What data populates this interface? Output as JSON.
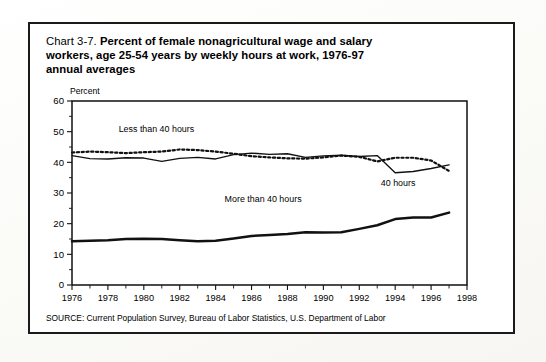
{
  "figure": {
    "number": "Chart 3-7.",
    "title": "Percent of female nonagricultural wage and salary workers, age 25-54 years by weekly hours at work, 1976-97 annual averages",
    "title_line1_lead": "Chart 3-7.",
    "title_line1_bold": "Percent of female nonagricultural wage and salary",
    "title_line2_bold": "workers, age 25-54 years by weekly hours at work, 1976-97",
    "title_line3_bold": "annual averages",
    "source": "SOURCE: Current Population Survey, Bureau of Labor Statistics, U.S. Department of Labor",
    "axis_unit_label": "Percent"
  },
  "colors": {
    "ink": "#111111",
    "paper": "#ffffff",
    "page": "#fdfdfb"
  },
  "chart_data": {
    "type": "line",
    "title": "Percent of female nonagricultural wage and salary workers, age 25-54 years by weekly hours at work, 1976-97 annual averages",
    "subtitle": "",
    "xlabel": "",
    "ylabel": "Percent",
    "xlim": [
      1976,
      1998
    ],
    "ylim": [
      0,
      60
    ],
    "yticks": [
      0,
      10,
      20,
      30,
      40,
      50,
      60
    ],
    "ytick_labels": [
      "0",
      "10",
      "20",
      "30",
      "40",
      "50",
      "60"
    ],
    "xticks": [
      1976,
      1978,
      1980,
      1982,
      1984,
      1986,
      1988,
      1990,
      1992,
      1994,
      1996,
      1998
    ],
    "xtick_labels": [
      "1976",
      "1978",
      "1980",
      "1982",
      "1984",
      "1986",
      "1988",
      "1990",
      "1992",
      "1994",
      "1996",
      "1998"
    ],
    "x_minor_tick_interval": 1,
    "grid": false,
    "legend": "inline-annotations",
    "x": [
      1976,
      1977,
      1978,
      1979,
      1980,
      1981,
      1982,
      1983,
      1984,
      1985,
      1986,
      1987,
      1988,
      1989,
      1990,
      1991,
      1992,
      1993,
      1994,
      1995,
      1996,
      1997
    ],
    "series": [
      {
        "name": "Less than 40 hours",
        "style": "dotted",
        "label_x": 1978.6,
        "label_y": 50.0,
        "values": [
          43.2,
          43.5,
          43.3,
          43.0,
          43.3,
          43.5,
          44.2,
          44.0,
          43.5,
          42.8,
          42.0,
          41.6,
          41.3,
          41.2,
          41.6,
          42.2,
          41.8,
          40.3,
          41.5,
          41.5,
          40.6,
          37.2
        ]
      },
      {
        "name": "40 hours",
        "style": "solid-thin",
        "label_x": 1993.2,
        "label_y": 32.4,
        "values": [
          42.2,
          41.2,
          41.1,
          41.5,
          41.4,
          40.3,
          41.3,
          41.6,
          41.1,
          42.5,
          43.0,
          42.6,
          42.8,
          41.6,
          42.1,
          42.3,
          41.9,
          42.2,
          36.6,
          37.0,
          38.0,
          39.2
        ]
      },
      {
        "name": "More than 40 hours",
        "style": "solid-thick",
        "label_x": 1984.5,
        "label_y": 27.1,
        "values": [
          14.3,
          14.4,
          14.6,
          15.0,
          15.1,
          15.0,
          14.6,
          14.3,
          14.4,
          15.2,
          16.0,
          16.3,
          16.6,
          17.2,
          17.1,
          17.2,
          18.3,
          19.5,
          21.5,
          22.0,
          22.0,
          23.6
        ]
      }
    ]
  }
}
